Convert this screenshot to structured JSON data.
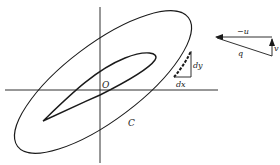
{
  "figure": {
    "colors": {
      "ink": "#1a1a1a",
      "background": "#ffffff"
    }
  },
  "labels": {
    "origin": "O",
    "contour": "C",
    "dx": "dx",
    "dy": "dy",
    "neg_u": "−u",
    "v": "v",
    "q": "q"
  },
  "elements": [
    {
      "name": "x-axis",
      "type": "line"
    },
    {
      "name": "y-axis",
      "type": "line"
    },
    {
      "name": "contour-C",
      "type": "closed-curve"
    },
    {
      "name": "airfoil",
      "type": "closed-curve"
    },
    {
      "name": "differential-triangle",
      "labels": [
        "dx",
        "dy"
      ]
    },
    {
      "name": "velocity-triangle",
      "labels": [
        "-u",
        "v",
        "q"
      ]
    }
  ]
}
